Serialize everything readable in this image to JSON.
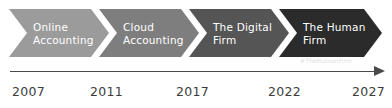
{
  "canvas": {
    "width": 392,
    "height": 108,
    "background": "#ffffff"
  },
  "chevrons": [
    {
      "label": "Online\nAccounting",
      "line1": "Online",
      "line2": "Accounting",
      "color": "#9b9b9b",
      "left": 9,
      "width": 100
    },
    {
      "label": "Cloud\nAccounting",
      "line1": "Cloud",
      "line2": "Accounting",
      "color": "#7e7e7e",
      "left": 99,
      "width": 100
    },
    {
      "label": "The Digital\nFirm",
      "line1": "The Digital",
      "line2": "Firm",
      "color": "#555555",
      "left": 189,
      "width": 100
    },
    {
      "label": "The Human\nFirm",
      "line1": "The Human",
      "line2": "Firm",
      "color": "#2b2b2b",
      "left": 279,
      "width": 103
    }
  ],
  "watermark": {
    "text": "#TheHumanFirm",
    "color": "#dddddd"
  },
  "axis": {
    "line_color": "#4a4a4a",
    "arrow_direction": "right"
  },
  "years": [
    {
      "value": "2007",
      "left": 12
    },
    {
      "value": "2011",
      "left": 90
    },
    {
      "value": "2017",
      "left": 176
    },
    {
      "value": "2022",
      "left": 268
    },
    {
      "value": "2027",
      "left": 352
    }
  ],
  "chart_data": {
    "type": "timeline",
    "title": "",
    "categories": [
      "2007",
      "2011",
      "2017",
      "2022",
      "2027"
    ],
    "stages": [
      {
        "name": "Online Accounting",
        "start": 2007,
        "end": 2011
      },
      {
        "name": "Cloud Accounting",
        "start": 2011,
        "end": 2017
      },
      {
        "name": "The Digital Firm",
        "start": 2017,
        "end": 2022
      },
      {
        "name": "The Human Firm",
        "start": 2022,
        "end": 2027
      }
    ],
    "xlabel": "",
    "ylabel": "",
    "grid": false,
    "legend": "none"
  }
}
